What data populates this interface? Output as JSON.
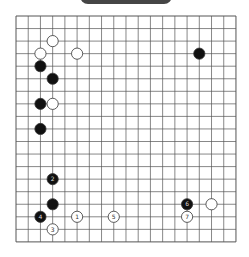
{
  "banner": {
    "label": ""
  },
  "board": {
    "size": 19,
    "origin": {
      "x": 16,
      "y": 16
    },
    "spacing": {
      "x": 12.22,
      "y": 12.55
    },
    "line_color": "#555555",
    "stones": [
      {
        "color": "white",
        "col": 3,
        "row": 2,
        "label": ""
      },
      {
        "color": "white",
        "col": 2,
        "row": 3,
        "label": ""
      },
      {
        "color": "white",
        "col": 5,
        "row": 3,
        "label": ""
      },
      {
        "color": "black",
        "col": 2,
        "row": 4,
        "label": ""
      },
      {
        "color": "black",
        "col": 3,
        "row": 5,
        "label": ""
      },
      {
        "color": "black",
        "col": 2,
        "row": 7,
        "label": ""
      },
      {
        "color": "white",
        "col": 3,
        "row": 7,
        "label": ""
      },
      {
        "color": "black",
        "col": 2,
        "row": 9,
        "label": ""
      },
      {
        "color": "black",
        "col": 15,
        "row": 3,
        "label": ""
      },
      {
        "color": "black",
        "col": 3,
        "row": 13,
        "label": "2"
      },
      {
        "color": "black",
        "col": 3,
        "row": 15,
        "label": ""
      },
      {
        "color": "black",
        "col": 2,
        "row": 16,
        "label": "4"
      },
      {
        "color": "white",
        "col": 3,
        "row": 17,
        "label": "3"
      },
      {
        "color": "white",
        "col": 5,
        "row": 16,
        "label": "1"
      },
      {
        "color": "white",
        "col": 8,
        "row": 16,
        "label": "5"
      },
      {
        "color": "black",
        "col": 14,
        "row": 15,
        "label": "6"
      },
      {
        "color": "white",
        "col": 16,
        "row": 15,
        "label": ""
      },
      {
        "color": "white",
        "col": 14,
        "row": 16,
        "label": "7"
      }
    ]
  },
  "caption": {
    "text": ""
  }
}
